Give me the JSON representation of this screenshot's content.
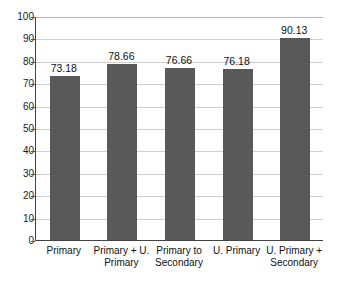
{
  "chart_data": {
    "type": "bar",
    "title": "",
    "xlabel": "",
    "ylabel": "",
    "ylim": [
      0,
      100
    ],
    "grid": true,
    "legend": "none",
    "categories": [
      "Primary",
      "Primary + U. Primary",
      "Primary to Secondary",
      "U. Primary",
      "U. Primary + Secondary"
    ],
    "category_lines": [
      "Primary",
      "Primary + U.\nPrimary",
      "Primary to\nSecondary",
      "U. Primary",
      "U. Primary +\nSecondary"
    ],
    "values": [
      73.18,
      78.66,
      76.66,
      76.18,
      90.13
    ],
    "value_labels": [
      "73.18",
      "78.66",
      "76.66",
      "76.18",
      "90.13"
    ],
    "yticks": [
      0,
      10,
      20,
      30,
      40,
      50,
      60,
      70,
      80,
      90,
      100
    ],
    "ytick_labels": [
      "0",
      "10",
      "20",
      "30",
      "40",
      "50",
      "60",
      "70",
      "80",
      "90",
      "100"
    ],
    "bar_color": "#595959",
    "grid_color": "#cfcfcf",
    "axis_color": "#444444",
    "background_color": "#ffffff"
  }
}
